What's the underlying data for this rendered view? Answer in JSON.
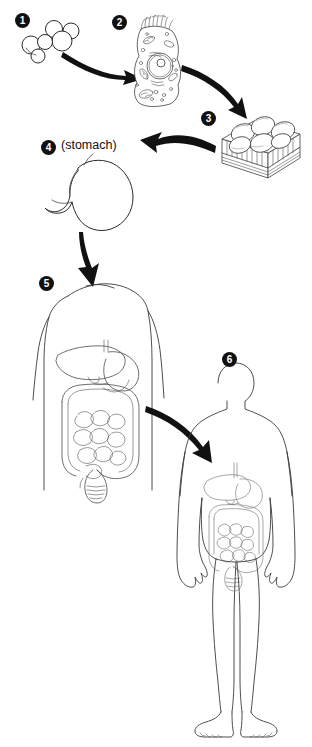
{
  "diagram": {
    "background_color": "#ffffff",
    "ink_color": "#1a1a1a",
    "badge_fill": "#111111",
    "badge_text_color": "#ffffff",
    "width": 312,
    "height": 747
  },
  "steps": [
    {
      "number": "1",
      "icon": "molecule-icon",
      "badge_x": 15,
      "badge_y": 13
    },
    {
      "number": "2",
      "icon": "cell-icon",
      "badge_x": 112,
      "badge_y": 15
    },
    {
      "number": "3",
      "icon": "tissue-block-icon",
      "badge_x": 201,
      "badge_y": 111
    },
    {
      "number": "4",
      "icon": "stomach-icon",
      "badge_x": 41,
      "badge_y": 140,
      "caption": "(stomach)",
      "caption_x": 61,
      "caption_y": 138
    },
    {
      "number": "5",
      "icon": "torso-digestive-system-icon",
      "badge_x": 39,
      "badge_y": 276
    },
    {
      "number": "6",
      "icon": "whole-body-icon",
      "badge_x": 222,
      "badge_y": 352
    }
  ],
  "arrows": [
    {
      "name": "arrow-molecule-to-cell",
      "direction": "right"
    },
    {
      "name": "arrow-cell-to-tissue",
      "direction": "down-right"
    },
    {
      "name": "arrow-tissue-to-organ",
      "direction": "left"
    },
    {
      "name": "arrow-organ-to-organ-system",
      "direction": "down"
    },
    {
      "name": "arrow-organ-system-to-organism",
      "direction": "down-right"
    }
  ]
}
